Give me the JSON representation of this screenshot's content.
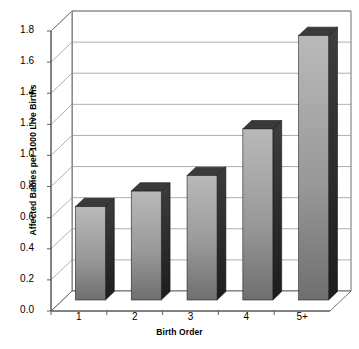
{
  "chart_data": {
    "type": "bar",
    "title": "",
    "subtitle": "",
    "xlabel": "Birth Order",
    "ylabel": "Affected Babies per 1000 Live Births",
    "categories": [
      "1",
      "2",
      "3",
      "4",
      "5+"
    ],
    "values": [
      0.6,
      0.7,
      0.8,
      1.1,
      1.7
    ],
    "series": [
      {
        "name": "Affected Babies per 1000 Live Births",
        "values": [
          0.6,
          0.7,
          0.8,
          1.1,
          1.7
        ]
      }
    ],
    "ylim": [
      0.0,
      1.8
    ],
    "ytick_step": 0.2,
    "ytick_labels": [
      "0.0",
      "0.2",
      "0.4",
      "0.6",
      "0.8",
      "1.0",
      "1.2",
      "1.4",
      "1.6",
      "1.8"
    ],
    "ytick_values": [
      0.0,
      0.2,
      0.4,
      0.6,
      0.8,
      1.0,
      1.2,
      1.4,
      1.6,
      1.8
    ],
    "grid": true,
    "grid_axis": "y",
    "legend": false,
    "legend_position": "none",
    "style": "3d-column",
    "colors": {
      "bar_front_top": "#b9b9b9",
      "bar_front_bottom": "#6f6f6f",
      "bar_side": "#2a2a2a",
      "bar_top": "#3a3a3a",
      "grid": "#8c8c8c",
      "axis": "#4d4d4d",
      "background": "#ffffff",
      "text": "#000000"
    }
  }
}
